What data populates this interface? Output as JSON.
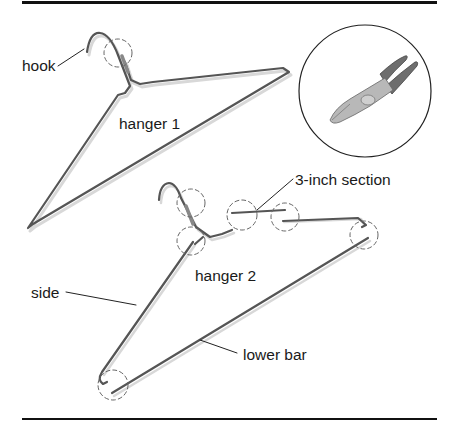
{
  "labels": {
    "hook": "hook",
    "hanger1": "hanger 1",
    "hanger2": "hanger 2",
    "section": "3-inch section",
    "side": "side",
    "lower_bar": "lower bar"
  },
  "colors": {
    "wire": "#555555",
    "wire_shadow": "#d8d8d8",
    "rule": "#111111",
    "dash_circle": "#666666",
    "plier_handle": "#6e6e6e",
    "plier_metal": "#b8b8b8",
    "text": "#1a1a1a"
  },
  "icons": [
    "wire-cutter-pliers-icon"
  ]
}
